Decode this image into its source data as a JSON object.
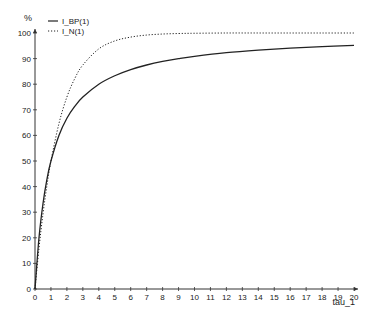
{
  "chart_data": {
    "type": "line",
    "title": "",
    "xlabel": "tau_1",
    "ylabel": "%",
    "xlim": [
      0,
      20
    ],
    "ylim": [
      0,
      100
    ],
    "xticks": [
      0,
      1,
      2,
      3,
      4,
      5,
      6,
      7,
      8,
      9,
      10,
      11,
      12,
      13,
      14,
      15,
      16,
      17,
      18,
      19,
      20
    ],
    "yticks": [
      0,
      10,
      20,
      30,
      40,
      50,
      60,
      70,
      80,
      90,
      100
    ],
    "grid": false,
    "legend_position": "top-left",
    "x": [
      0,
      0.25,
      0.5,
      0.75,
      1,
      1.5,
      2,
      2.5,
      3,
      4,
      5,
      6,
      7,
      8,
      9,
      10,
      12,
      14,
      16,
      18,
      20
    ],
    "series": [
      {
        "name": "I_BP(1)",
        "style": "solid",
        "color": "#222222",
        "values": [
          0,
          20,
          33.3,
          42.9,
          50,
          60,
          66.7,
          71.4,
          75,
          80,
          83.3,
          85.7,
          87.5,
          88.9,
          90,
          90.9,
          92.3,
          93.3,
          94.1,
          94.7,
          95.2
        ]
      },
      {
        "name": "I_N(1)",
        "style": "dotted",
        "color": "#222222",
        "values": [
          0,
          15.9,
          29.3,
          40.5,
          50,
          64.6,
          75,
          82.3,
          87.5,
          93.8,
          96.9,
          98.4,
          99.2,
          99.6,
          99.8,
          99.9,
          100,
          100,
          100,
          100,
          100
        ]
      }
    ]
  },
  "legend": {
    "items": [
      "I_BP(1)",
      "I_N(1)"
    ]
  },
  "axes": {
    "x_label": "tau_1",
    "y_label": "%"
  }
}
